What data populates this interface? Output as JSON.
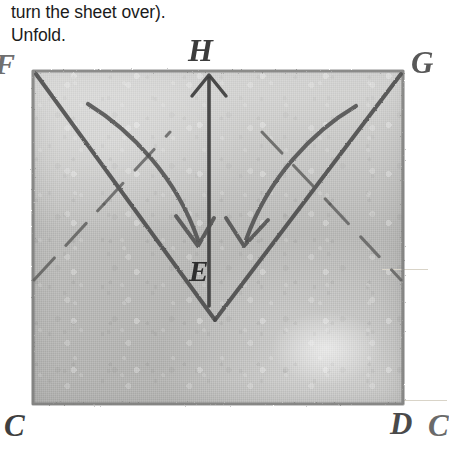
{
  "instructions": {
    "line1": "turn the sheet over).",
    "line2": "Unfold."
  },
  "diagram": {
    "type": "origami-fold-step",
    "paper": {
      "shape": "rectangle",
      "fill_color": "#c0c0be",
      "border_color": "#8a8a88",
      "texture": "hand-drawn pencil on textured paper"
    },
    "vertex_labels": [
      {
        "id": "F",
        "text": "F",
        "position": "top-left-outside",
        "clipped": true
      },
      {
        "id": "H",
        "text": "H",
        "position": "top-center-above",
        "clipped": false
      },
      {
        "id": "G",
        "text": "G",
        "position": "top-right-outside",
        "clipped": false
      },
      {
        "id": "E",
        "text": "E",
        "position": "center",
        "clipped": false
      },
      {
        "id": "C",
        "text": "C",
        "position": "bottom-left-outside",
        "clipped": false
      },
      {
        "id": "D",
        "text": "D",
        "position": "bottom-right-outside",
        "clipped": false
      },
      {
        "id": "C2",
        "text": "C",
        "position": "bottom-far-right-outside",
        "clipped": true
      }
    ],
    "fold_lines": [
      {
        "name": "valley-fold-left",
        "style": "solid",
        "from": "top-left-corner",
        "to": "bottom-center-vertex"
      },
      {
        "name": "valley-fold-right",
        "style": "solid",
        "from": "top-right-corner",
        "to": "bottom-center-vertex"
      },
      {
        "name": "crease-left",
        "style": "dashed",
        "from": "left-edge-mid",
        "to": "apex-left"
      },
      {
        "name": "crease-right",
        "style": "dashed",
        "from": "right-edge-mid",
        "to": "apex-right"
      },
      {
        "name": "center-vertical",
        "style": "dashed-solid",
        "from": "bottom-center-vertex",
        "to": "bottom-edge"
      }
    ],
    "arrows": [
      {
        "name": "up-arrow-to-H",
        "direction": "up",
        "style": "straight",
        "head": "open-v"
      },
      {
        "name": "curved-arrow-left",
        "direction": "down-right",
        "style": "curved",
        "head": "open-v"
      },
      {
        "name": "curved-arrow-right",
        "direction": "down-left",
        "style": "curved",
        "head": "open-v"
      }
    ],
    "colors": {
      "ink": "#4f4f4f",
      "ink_dark": "#3a3a3a",
      "paper_light": "#cdcdcb",
      "paper_dark": "#b6b6b4",
      "tick": "#d9d4c8"
    }
  }
}
